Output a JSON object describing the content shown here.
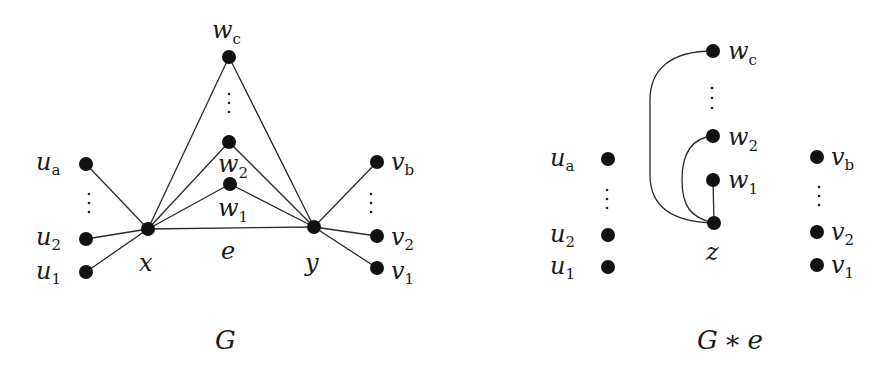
{
  "figures": [
    {
      "id": "G",
      "caption": "G",
      "nodes": [
        {
          "id": "wc",
          "label": "w",
          "sub": "c",
          "x": 229,
          "y": 57
        },
        {
          "id": "w2",
          "label": "w",
          "sub": "2",
          "x": 229,
          "y": 142
        },
        {
          "id": "w1",
          "label": "w",
          "sub": "1",
          "x": 230,
          "y": 184
        },
        {
          "id": "x",
          "label": "x",
          "sub": "",
          "x": 148,
          "y": 229
        },
        {
          "id": "y",
          "label": "y",
          "sub": "",
          "x": 314,
          "y": 227
        },
        {
          "id": "ua",
          "label": "u",
          "sub": "a",
          "x": 86,
          "y": 164
        },
        {
          "id": "u2",
          "label": "u",
          "sub": "2",
          "x": 86,
          "y": 239
        },
        {
          "id": "u1",
          "label": "u",
          "sub": "1",
          "x": 86,
          "y": 272
        },
        {
          "id": "vb",
          "label": "v",
          "sub": "b",
          "x": 377,
          "y": 162
        },
        {
          "id": "v2",
          "label": "v",
          "sub": "2",
          "x": 377,
          "y": 236
        },
        {
          "id": "v1",
          "label": "v",
          "sub": "1",
          "x": 377,
          "y": 268
        }
      ],
      "edges": [
        [
          "x",
          "y"
        ],
        [
          "x",
          "wc"
        ],
        [
          "x",
          "w2"
        ],
        [
          "x",
          "w1"
        ],
        [
          "y",
          "wc"
        ],
        [
          "y",
          "w2"
        ],
        [
          "y",
          "w1"
        ],
        [
          "x",
          "ua"
        ],
        [
          "x",
          "u2"
        ],
        [
          "x",
          "u1"
        ],
        [
          "y",
          "vb"
        ],
        [
          "y",
          "v2"
        ],
        [
          "y",
          "v1"
        ]
      ],
      "edge_label": "e"
    },
    {
      "id": "G*e",
      "caption": "G ∗ e",
      "nodes": [
        {
          "id": "wc",
          "label": "w",
          "sub": "c",
          "x": 713,
          "y": 51
        },
        {
          "id": "w2",
          "label": "w",
          "sub": "2",
          "x": 713,
          "y": 136
        },
        {
          "id": "w1",
          "label": "w",
          "sub": "1",
          "x": 713,
          "y": 180
        },
        {
          "id": "z",
          "label": "z",
          "sub": "",
          "x": 714,
          "y": 223
        },
        {
          "id": "ua",
          "label": "u",
          "sub": "a",
          "x": 608,
          "y": 159
        },
        {
          "id": "u2",
          "label": "u",
          "sub": "2",
          "x": 608,
          "y": 235
        },
        {
          "id": "u1",
          "label": "u",
          "sub": "1",
          "x": 608,
          "y": 267
        },
        {
          "id": "vb",
          "label": "v",
          "sub": "b",
          "x": 817,
          "y": 157
        },
        {
          "id": "v2",
          "label": "v",
          "sub": "2",
          "x": 817,
          "y": 232
        },
        {
          "id": "v1",
          "label": "v",
          "sub": "1",
          "x": 817,
          "y": 265
        }
      ],
      "edges": [
        [
          "z",
          "w1"
        ],
        [
          "z",
          "w2"
        ],
        [
          "z",
          "wc"
        ]
      ]
    }
  ],
  "labels": {
    "g_caption": "G",
    "ge_caption_G": "G",
    "ge_caption_op": "∗",
    "ge_caption_e": "e",
    "edge_e": "e",
    "x": "x",
    "y": "y",
    "z": "z",
    "w": "w",
    "u": "u",
    "v": "v",
    "sub_c": "c",
    "sub_a": "a",
    "sub_b": "b",
    "sub_1": "1",
    "sub_2": "2",
    "ellipsis": "⋮"
  }
}
